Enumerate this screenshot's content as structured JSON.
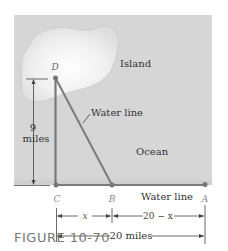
{
  "figure": {
    "caption": "FIGURE  10-70",
    "labels": {
      "island": "Island",
      "ocean": "Ocean",
      "water_line_diagonal": "Water line",
      "water_line_shore": "Water line",
      "point_d": "D",
      "point_c": "C",
      "point_b": "B",
      "point_a": "A",
      "height_value": "9",
      "height_unit": "miles",
      "dim_x": "x",
      "dim_20_minus_x": "20 − x",
      "dim_total": "20 miles"
    },
    "colors": {
      "ocean": "#d6d6d6",
      "island": "#f4f4f4",
      "line": "#7a7a7a",
      "text": "#333333",
      "point_label": "#888888"
    }
  }
}
